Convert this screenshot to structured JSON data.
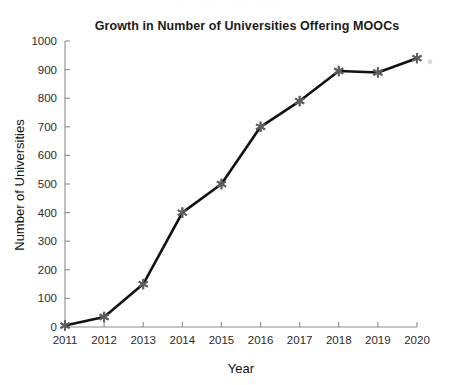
{
  "artifact": {
    "top_strip_text": "- -- -  -   --  -  -    -- -   -  --"
  },
  "chart_data": {
    "type": "line",
    "title": "Growth in Number of Universities Offering MOOCs",
    "xlabel": "Year",
    "ylabel": "Number of Universities",
    "categories": [
      "2011",
      "2012",
      "2013",
      "2014",
      "2015",
      "2016",
      "2017",
      "2018",
      "2019",
      "2020"
    ],
    "x": [
      2011,
      2012,
      2013,
      2014,
      2015,
      2016,
      2017,
      2018,
      2019,
      2020
    ],
    "values": [
      5,
      35,
      150,
      400,
      500,
      700,
      790,
      895,
      890,
      940
    ],
    "xlim": [
      2011,
      2020
    ],
    "ylim": [
      0,
      1000
    ],
    "yticks": [
      0,
      100,
      200,
      300,
      400,
      500,
      600,
      700,
      800,
      900,
      1000
    ],
    "ytick_labels": [
      "0",
      "100",
      "200",
      "300",
      "400",
      "500",
      "600",
      "700",
      "800",
      "900",
      "1000"
    ],
    "xticks": [
      2011,
      2012,
      2013,
      2014,
      2015,
      2016,
      2017,
      2018,
      2019,
      2020
    ],
    "xtick_labels": [
      "2011",
      "2012",
      "2013",
      "2014",
      "2015",
      "2016",
      "2017",
      "2018",
      "2019",
      "2020"
    ],
    "grid": false,
    "legend": null,
    "legend_position": "none",
    "marker": "asterisk",
    "marker_color": "#5e5e5e",
    "line_color": "#111111",
    "background_color": "#ffffff",
    "axis_color": "#8b8b8b"
  }
}
